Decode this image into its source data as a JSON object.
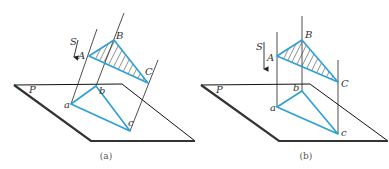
{
  "figure": {
    "panels": [
      {
        "id": "a",
        "caption": "(a)",
        "projection_type": "oblique",
        "labels": {
          "S": "S",
          "A": "A",
          "B": "B",
          "C": "C",
          "P": "P",
          "a": "a",
          "b": "b",
          "c": "c"
        }
      },
      {
        "id": "b",
        "caption": "(b)",
        "projection_type": "orthogonal",
        "labels": {
          "S": "S",
          "A": "A",
          "B": "B",
          "C": "C",
          "P": "P",
          "a": "a",
          "b": "b",
          "c": "c"
        }
      }
    ],
    "colors": {
      "triangle": "#2b9fd6",
      "lines": "#222222",
      "plane_thick_edge": "#333333"
    }
  }
}
